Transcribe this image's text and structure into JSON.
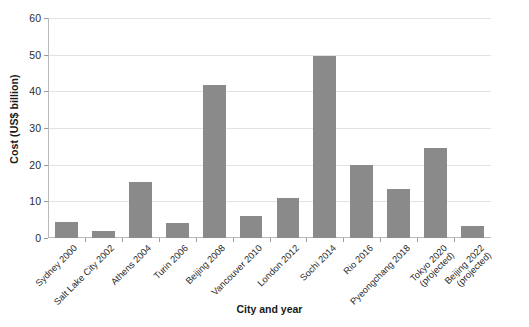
{
  "chart_data": {
    "type": "bar",
    "title": "",
    "xlabel": "City and year",
    "ylabel": "Cost (US$ billion)",
    "ylim": [
      0,
      60
    ],
    "yticks": [
      0,
      10,
      20,
      30,
      40,
      50,
      60
    ],
    "ytick_labels": [
      "0",
      "10",
      "20",
      "30",
      "40",
      "50",
      "60"
    ],
    "grid": "horizontal",
    "legend": "none",
    "bar_color": "#8a8a8a",
    "categories": [
      "Sydney 2000",
      "Salt Lake City 2002",
      "Athens 2004",
      "Turin 2006",
      "Beijing 2008",
      "Vancouver 2010",
      "London 2012",
      "Sochi 2014",
      "Rio 2016",
      "Pyeongchang 2018",
      "Tokyo 2020 (projected)",
      "Beijing 2022 (projected)"
    ],
    "category_lines": [
      [
        "Sydney 2000",
        ""
      ],
      [
        "Salt Lake City 2002",
        ""
      ],
      [
        "Athens 2004",
        ""
      ],
      [
        "Turin 2006",
        ""
      ],
      [
        "Beijing 2008",
        ""
      ],
      [
        "Vancouver 2010",
        ""
      ],
      [
        "London 2012",
        ""
      ],
      [
        "Sochi 2014",
        ""
      ],
      [
        "Rio 2016",
        ""
      ],
      [
        "Pyeongchang 2018",
        ""
      ],
      [
        "Tokyo 2020",
        "(projected)"
      ],
      [
        "Beijing 2022",
        "(projected)"
      ]
    ],
    "values": [
      4.5,
      1.8,
      15.2,
      4.0,
      41.7,
      6.1,
      11.0,
      49.7,
      19.8,
      13.4,
      24.5,
      3.4
    ]
  }
}
